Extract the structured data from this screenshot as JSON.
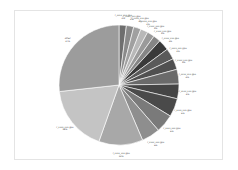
{
  "chart_data": {
    "type": "pie",
    "title": "",
    "start_angle_deg": 90,
    "direction": "clockwise",
    "center": [
      119,
      85
    ],
    "radius": 60,
    "slices": [
      {
        "label": "r_xxxx_xxx.gpu",
        "value": 2,
        "pct": "2%",
        "color": "#6e6e6e"
      },
      {
        "label": "r_xxxx_xxx.gpu",
        "value": 2,
        "pct": "2%",
        "color": "#8a8a8a"
      },
      {
        "label": "r_xxxx_xxx.gpu",
        "value": 2,
        "pct": "2%",
        "color": "#a0a0a0"
      },
      {
        "label": "r_xxxx_xxx.gpu",
        "value": 2,
        "pct": "2%",
        "color": "#b8b8b8"
      },
      {
        "label": "r_xxxx_xxx.gpu",
        "value": 2,
        "pct": "2%",
        "color": "#9a9a9a"
      },
      {
        "label": "r_xxxx_xxx.gpu",
        "value": 2,
        "pct": "2%",
        "color": "#858585"
      },
      {
        "label": "r_xxxx_xxx.gpu",
        "value": 3,
        "pct": "3%",
        "color": "#3a3a3a"
      },
      {
        "label": "r_xxxx_xxx.gpu",
        "value": 3,
        "pct": "3%",
        "color": "#5a5a5a"
      },
      {
        "label": "r_xxxx_xxx.gpu",
        "value": 3,
        "pct": "3%",
        "color": "#505050"
      },
      {
        "label": "r_xxxx_xxx.gpu",
        "value": 4,
        "pct": "4%",
        "color": "#6a6a6a"
      },
      {
        "label": "r_xxxx_xxx.gpu",
        "value": 4,
        "pct": "4%",
        "color": "#454545"
      },
      {
        "label": "r_xxxx_xxx.gpu",
        "value": 5,
        "pct": "5%",
        "color": "#4a4a4a"
      },
      {
        "label": "r_xxxx_xxx.gpu",
        "value": 5,
        "pct": "5%",
        "color": "#7a7a7a"
      },
      {
        "label": "r_xxxx_xxx.gpu",
        "value": 5,
        "pct": "5%",
        "color": "#8e8e8e"
      },
      {
        "label": "r_xxxx_xxx.gpu",
        "value": 12,
        "pct": "12%",
        "color": "#a8a8a8"
      },
      {
        "label": "r_xxxx_xxx.gpu",
        "value": 18,
        "pct": "18%",
        "color": "#c4c4c4"
      },
      {
        "label": "other",
        "value": 27,
        "pct": "27%",
        "color": "#9c9c9c"
      }
    ],
    "legend": "none",
    "labels_outside": true
  }
}
